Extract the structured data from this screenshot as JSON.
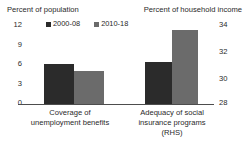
{
  "chart_data": {
    "type": "bar",
    "title": "",
    "categories": [
      "Coverage of unemployment benefits",
      "Adequacy of social insurance programs (RHS)"
    ],
    "category_lines": [
      [
        "Coverage of",
        "unemployment benefits"
      ],
      [
        "Adequacy of social",
        "insurance programs",
        "(RHS)"
      ]
    ],
    "series": [
      {
        "name": "2000-08",
        "color": "#2b2b2b",
        "values": [
          6.0,
          31.1
        ],
        "axis": [
          "left",
          "right"
        ]
      },
      {
        "name": "2010-18",
        "color": "#6b6b6b",
        "values": [
          5.0,
          33.7
        ],
        "axis": [
          "left",
          "right"
        ]
      }
    ],
    "axes": {
      "left": {
        "title": "Percent of population",
        "ticks": [
          "0",
          "3",
          "6",
          "9",
          "12"
        ],
        "ylim": [
          0,
          12
        ]
      },
      "right": {
        "title": "Percent of household income",
        "ticks": [
          "28",
          "30",
          "32",
          "34"
        ],
        "ylim": [
          28,
          34
        ]
      }
    },
    "legend": {
      "position": "top-center",
      "entries": [
        {
          "label": "2000-08",
          "color": "#2b2b2b"
        },
        {
          "label": "2010-18",
          "color": "#6b6b6b"
        }
      ]
    },
    "grid": false,
    "xlabel": "",
    "ylabel": "Percent of population"
  },
  "geometry": {
    "bars": [
      {
        "name": "bar-coverage-2000-08",
        "left": 18,
        "width": 30,
        "height_px": 40,
        "color": "#2b2b2b"
      },
      {
        "name": "bar-coverage-2010-18",
        "left": 48,
        "width": 30,
        "height_px": 33,
        "color": "#6b6b6b"
      },
      {
        "name": "bar-adequacy-2000-08",
        "left": 119,
        "width": 27,
        "height_px": 42,
        "color": "#2b2b2b"
      },
      {
        "name": "bar-adequacy-2010-18",
        "left": 146,
        "width": 26,
        "height_px": 74,
        "color": "#6b6b6b"
      }
    ],
    "ticks_left": [
      {
        "label": "12",
        "top": 21
      },
      {
        "label": "9",
        "top": 41
      },
      {
        "label": "6",
        "top": 60
      },
      {
        "label": "3",
        "top": 80
      },
      {
        "label": "0",
        "top": 99
      }
    ],
    "ticks_right": [
      {
        "label": "34",
        "top": 21
      },
      {
        "label": "32",
        "top": 48
      },
      {
        "label": "30",
        "top": 75
      },
      {
        "label": "28",
        "top": 99
      }
    ]
  }
}
